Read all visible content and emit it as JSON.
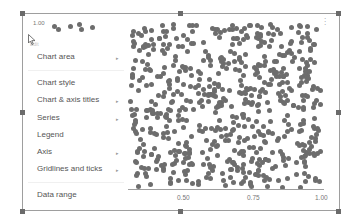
{
  "chart_data": {
    "type": "scatter",
    "title": "",
    "xlabel": "",
    "ylabel": "",
    "x_ticks": [
      "0.50",
      "0.75",
      "1.00"
    ],
    "y_ticks": [
      "1.00"
    ],
    "xlim": [
      0.25,
      1.0
    ],
    "ylim": [
      0,
      1.0
    ],
    "grid": false,
    "point_color": "#6d6d6d"
  },
  "chart": {
    "y_top_label": "1.00",
    "x_ticks": [
      "0.50",
      "0.75",
      "1.00"
    ],
    "more_icon": "⋮"
  },
  "menu": {
    "header": "Edit",
    "items": [
      {
        "label": "Chart area",
        "submenu": true
      },
      {
        "label": "Chart style",
        "submenu": false
      },
      {
        "label": "Chart & axis titles",
        "submenu": true
      },
      {
        "label": "Series",
        "submenu": true
      },
      {
        "label": "Legend",
        "submenu": false
      },
      {
        "label": "Axis",
        "submenu": true
      },
      {
        "label": "Gridlines and ticks",
        "submenu": true
      },
      {
        "label": "Data range",
        "submenu": false
      }
    ],
    "arrow": "▸"
  },
  "colors": {
    "frame": "#9e9e9e",
    "handle": "#6b6b6b",
    "points": "#6d6d6d",
    "text": "#555555"
  }
}
